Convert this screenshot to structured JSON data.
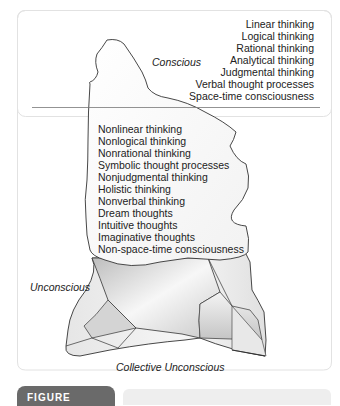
{
  "figure": {
    "levels": {
      "conscious": "Conscious",
      "unconscious": "Unconscious",
      "collective_unconscious": "Collective Unconscious"
    },
    "conscious_traits": [
      "Linear thinking",
      "Logical thinking",
      "Rational thinking",
      "Analytical thinking",
      "Judgmental thinking",
      "Verbal thought processes",
      "Space-time consciousness"
    ],
    "unconscious_traits": [
      "Nonlinear thinking",
      "Nonlogical thinking",
      "Nonrational thinking",
      "Symbolic thought processes",
      "Nonjudgmental thinking",
      "Holistic thinking",
      "Nonverbal thinking",
      "Dream thoughts",
      "Intuitive thoughts",
      "Imaginative thoughts",
      "Non-space-time consciousness"
    ],
    "caption_tab": "FIGURE",
    "colors": {
      "outline": "#333333",
      "waterline": "#777777",
      "frame": "#e2e2e2",
      "tab": "#6a6a6a",
      "caption_bar": "#eeeeee"
    }
  }
}
